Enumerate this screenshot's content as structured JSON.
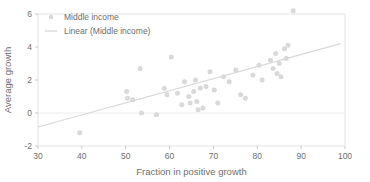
{
  "chart_data": {
    "type": "scatter",
    "title": "",
    "xlabel": "Fraction in positive growth",
    "ylabel": "Average growth",
    "xlim": [
      30,
      100
    ],
    "ylim": [
      -2,
      6
    ],
    "xticks": [
      30,
      40,
      50,
      60,
      70,
      80,
      90,
      100
    ],
    "yticks": [
      -2,
      0,
      2,
      4,
      6
    ],
    "grid": false,
    "legend_position": "top-left",
    "legend": [
      {
        "label": "Middle income",
        "marker": "circle",
        "color": "#d9d9d9"
      },
      {
        "label": "Linear (Middle income)",
        "marker": "line",
        "color": "#d9d9d9"
      }
    ],
    "series": [
      {
        "name": "Middle income",
        "type": "scatter",
        "color": "#d9d9d9",
        "marker_size": 5,
        "points": [
          [
            39.5,
            -1.2
          ],
          [
            50.2,
            1.3
          ],
          [
            50.4,
            0.9
          ],
          [
            51.6,
            0.8
          ],
          [
            53.3,
            2.7
          ],
          [
            53.6,
            0.0
          ],
          [
            57.0,
            -0.1
          ],
          [
            58.8,
            1.5
          ],
          [
            59.4,
            1.1
          ],
          [
            60.4,
            3.4
          ],
          [
            61.8,
            1.2
          ],
          [
            62.8,
            0.5
          ],
          [
            63.4,
            1.9
          ],
          [
            64.4,
            1.0
          ],
          [
            64.7,
            0.6
          ],
          [
            65.5,
            1.3
          ],
          [
            65.9,
            2.0
          ],
          [
            66.2,
            0.7
          ],
          [
            66.5,
            0.2
          ],
          [
            67.0,
            1.5
          ],
          [
            67.6,
            0.3
          ],
          [
            68.3,
            1.6
          ],
          [
            69.2,
            2.5
          ],
          [
            70.2,
            1.4
          ],
          [
            71.0,
            0.6
          ],
          [
            72.3,
            2.2
          ],
          [
            73.6,
            1.9
          ],
          [
            75.1,
            2.6
          ],
          [
            76.2,
            1.1
          ],
          [
            77.3,
            0.9
          ],
          [
            79.0,
            2.3
          ],
          [
            80.4,
            2.9
          ],
          [
            81.1,
            2.0
          ],
          [
            83.0,
            3.2
          ],
          [
            83.6,
            2.7
          ],
          [
            84.2,
            3.6
          ],
          [
            84.5,
            2.4
          ],
          [
            85.0,
            3.0
          ],
          [
            85.4,
            2.2
          ],
          [
            86.2,
            3.9
          ],
          [
            86.6,
            3.3
          ],
          [
            87.0,
            4.1
          ],
          [
            88.2,
            6.2
          ]
        ]
      },
      {
        "name": "Linear (Middle income)",
        "type": "line",
        "color": "#d9d9d9",
        "endpoints": [
          [
            30,
            -0.85
          ],
          [
            99,
            4.2
          ]
        ]
      }
    ]
  }
}
